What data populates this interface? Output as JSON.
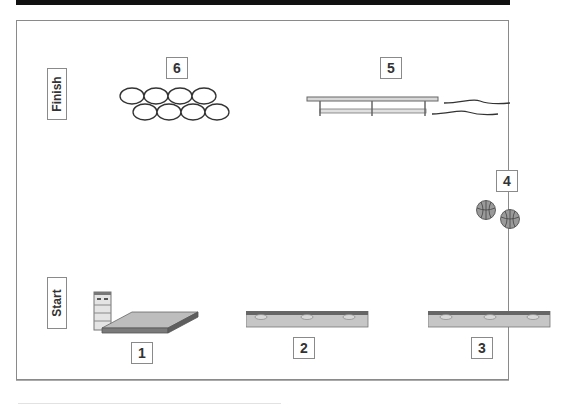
{
  "diagram": {
    "title_bar_color": "#111111",
    "zones": {
      "finish": "Finish",
      "start": "Start"
    },
    "stations": [
      {
        "number": "1",
        "equipment": "vaulting-box-and-mat"
      },
      {
        "number": "2",
        "equipment": "balance-bench"
      },
      {
        "number": "3",
        "equipment": "balance-bench"
      },
      {
        "number": "4",
        "equipment": "basketballs"
      },
      {
        "number": "5",
        "equipment": "bench-and-ropes"
      },
      {
        "number": "6",
        "equipment": "hoops"
      }
    ],
    "colors": {
      "frame": "#8a8a8a",
      "equipment_fill": "#c8c8c8",
      "equipment_dark": "#6e6e6e",
      "text": "#333333"
    }
  }
}
